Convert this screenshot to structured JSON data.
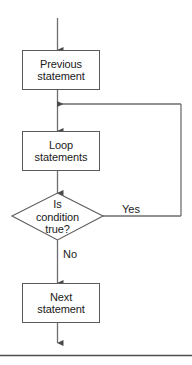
{
  "diagram": {
    "colors": {
      "stroke": "#5a5a5a",
      "line": "#6e6e6e",
      "text": "#1a1a1a",
      "background": "#ffffff",
      "rule": "#4d4d4d"
    },
    "nodes": [
      {
        "id": "previous",
        "type": "process",
        "label": "Previous\nstatement"
      },
      {
        "id": "loop",
        "type": "process",
        "label": "Loop\nstatements"
      },
      {
        "id": "decision",
        "type": "decision",
        "label": "Is\ncondition\ntrue?"
      },
      {
        "id": "next",
        "type": "process",
        "label": "Next\nstatement"
      }
    ],
    "edges": [
      {
        "id": "entry",
        "from": "",
        "to": "previous",
        "label": ""
      },
      {
        "id": "previous-to-loop",
        "from": "previous",
        "to": "loop",
        "label": ""
      },
      {
        "id": "loop-to-decision",
        "from": "loop",
        "to": "decision",
        "label": ""
      },
      {
        "id": "decision-yes",
        "from": "decision",
        "to": "loop",
        "label": "Yes"
      },
      {
        "id": "decision-no",
        "from": "decision",
        "to": "next",
        "label": "No"
      },
      {
        "id": "exit",
        "from": "next",
        "to": "",
        "label": ""
      }
    ]
  },
  "footer": {
    "rule_present": "true"
  }
}
